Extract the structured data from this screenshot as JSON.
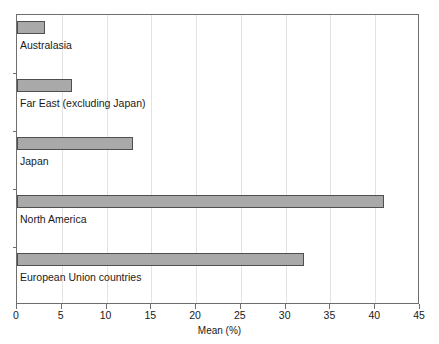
{
  "chart_data": {
    "type": "bar",
    "orientation": "horizontal",
    "title": "",
    "xlabel": "Mean (%)",
    "ylabel": "",
    "categories": [
      "Australasia",
      "Far East (excluding Japan)",
      "Japan",
      "North America",
      "European Union countries"
    ],
    "values": [
      3.1,
      6.1,
      13.0,
      41.0,
      32.1
    ],
    "xlim": [
      0,
      45
    ],
    "xticks": [
      0,
      5,
      10,
      15,
      20,
      25,
      30,
      35,
      40,
      45
    ],
    "xticklabels": [
      "0",
      "5",
      "10",
      "15",
      "20",
      "25",
      "30",
      "35",
      "40",
      "45"
    ],
    "grid": "vertical",
    "legend": null,
    "bar_color": "#a9a9a9",
    "bar_edge_color": "#4f4f4f",
    "gridline_color": "#e3e3e3",
    "axis_color": "#6e6e6e"
  }
}
